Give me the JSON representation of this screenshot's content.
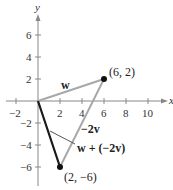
{
  "figure": {
    "type": "vector-diagram",
    "axes": {
      "x_label": "x",
      "y_label": "y",
      "x_ticks": [
        "−2",
        "2",
        "4",
        "6",
        "8",
        "10"
      ],
      "y_ticks_pos": [
        "2",
        "4",
        "6"
      ],
      "y_ticks_neg": [
        "−2",
        "−4",
        "−6"
      ]
    },
    "points": {
      "p1": {
        "label": "(6, 2)",
        "x": 6,
        "y": 2
      },
      "p2": {
        "label": "(2, −6)",
        "x": 2,
        "y": -6
      }
    },
    "vectors": {
      "w": {
        "label": "w",
        "from": [
          0,
          0
        ],
        "to": [
          6,
          2
        ],
        "color": "#a8a8a8"
      },
      "neg2v": {
        "label": "−2v",
        "from": [
          6,
          2
        ],
        "to": [
          2,
          -6
        ],
        "color": "#a8a8a8"
      },
      "sum": {
        "label": "w + (−2v)",
        "from": [
          0,
          0
        ],
        "to": [
          2,
          -6
        ],
        "color": "#1a1a1a"
      }
    }
  }
}
